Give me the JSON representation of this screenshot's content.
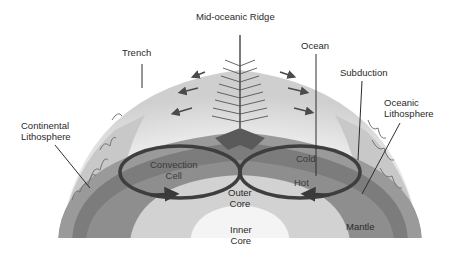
{
  "diagram": {
    "type": "earth cross-section / plate tectonics",
    "labels": {
      "ridge": "Mid-oceanic Ridge",
      "trench": "Trench",
      "ocean": "Ocean",
      "subduction": "Subduction",
      "oceanic_litho_1": "Oceanic",
      "oceanic_litho_2": "Lithosphere",
      "continental_litho_1": "Continental",
      "continental_litho_2": "Lithosphere",
      "convection_1": "Convection",
      "convection_2": "Cell",
      "cold": "Cold",
      "hot": "Hot",
      "outer_core_1": "Outer",
      "outer_core_2": "Core",
      "inner_core_1": "Inner",
      "inner_core_2": "Core",
      "mantle": "Mantle"
    },
    "colors": {
      "background": "#ffffff",
      "surface": "#e6e6e6",
      "surface_light": "#f2f2f2",
      "lithosphere": "#8a8a8a",
      "upper_mantle": "#7a7a7a",
      "mantle": "#8c8c8c",
      "outer_core": "#d2d2d2",
      "inner_core": "#f4f4f4",
      "continent": "#c4c4c4",
      "arrows": "#4a4a4a",
      "leader_lines": "#2e2e2e",
      "text": "#2a2a2a"
    }
  }
}
